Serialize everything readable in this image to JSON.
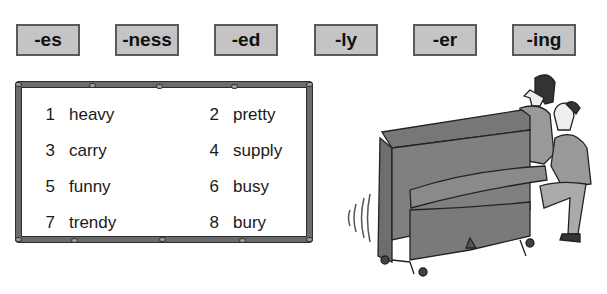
{
  "suffixes": [
    "-es",
    "-ness",
    "-ed",
    "-ly",
    "-er",
    "-ing"
  ],
  "words": [
    {
      "num": "1",
      "word": "heavy"
    },
    {
      "num": "2",
      "word": "pretty"
    },
    {
      "num": "3",
      "word": "carry"
    },
    {
      "num": "4",
      "word": "supply"
    },
    {
      "num": "5",
      "word": "funny"
    },
    {
      "num": "6",
      "word": "busy"
    },
    {
      "num": "7",
      "word": "trendy"
    },
    {
      "num": "8",
      "word": "bury"
    }
  ],
  "illustration": {
    "description": "two people moving an upright piano"
  },
  "colors": {
    "suffix_bg": "#c4c4c4",
    "suffix_border": "#5a5a5a",
    "frame": "#6b6b6b"
  }
}
